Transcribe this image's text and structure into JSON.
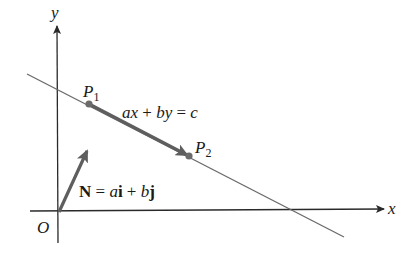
{
  "diagram": {
    "axes": {
      "x_label": "x",
      "y_label": "y",
      "origin_label": "O"
    },
    "line": {
      "equation": {
        "a": "a",
        "x": "x",
        "plus": " + ",
        "b": "b",
        "y": "y",
        "eq": " = ",
        "c": "c"
      }
    },
    "points": [
      {
        "name": "P",
        "sub": "1"
      },
      {
        "name": "P",
        "sub": "2"
      }
    ],
    "normal_vector": {
      "symbol": "N",
      "eq": " = ",
      "a": "a",
      "i": "i",
      "plus": " + ",
      "b": "b",
      "j": "j"
    },
    "colors": {
      "axis": "#2a2a2a",
      "line": "#6b6b6b",
      "vector": "#5e5e5e",
      "point": "#6b6b6b",
      "text": "#1a1a1a"
    }
  }
}
